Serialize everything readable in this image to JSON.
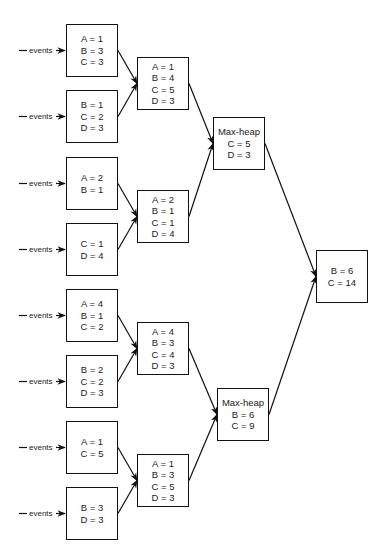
{
  "diagram": {
    "input_label": "events",
    "leaves": [
      {
        "id": "leaf1",
        "lines": [
          "A = 1",
          "B = 3",
          "C = 3"
        ]
      },
      {
        "id": "leaf2",
        "lines": [
          "B = 1",
          "C = 2",
          "D = 3"
        ]
      },
      {
        "id": "leaf3",
        "lines": [
          "A = 2",
          "B = 1"
        ]
      },
      {
        "id": "leaf4",
        "lines": [
          "C = 1",
          "D = 4"
        ]
      },
      {
        "id": "leaf5",
        "lines": [
          "A = 4",
          "B = 1",
          "C = 2"
        ]
      },
      {
        "id": "leaf6",
        "lines": [
          "B = 2",
          "C = 2",
          "D = 3"
        ]
      },
      {
        "id": "leaf7",
        "lines": [
          "A = 1",
          "C = 5"
        ]
      },
      {
        "id": "leaf8",
        "lines": [
          "B = 3",
          "D = 3"
        ]
      }
    ],
    "merges": [
      {
        "id": "merge1",
        "lines": [
          "A = 1",
          "B = 4",
          "C = 5",
          "D = 3"
        ]
      },
      {
        "id": "merge2",
        "lines": [
          "A = 2",
          "B = 1",
          "C = 1",
          "D = 4"
        ]
      },
      {
        "id": "merge3",
        "lines": [
          "A = 4",
          "B = 3",
          "C = 4",
          "D = 3"
        ]
      },
      {
        "id": "merge4",
        "lines": [
          "A = 1",
          "B = 3",
          "C = 5",
          "D = 3"
        ]
      }
    ],
    "heaps": [
      {
        "id": "heap1",
        "lines": [
          "Max-heap",
          "C = 5",
          "D = 3"
        ]
      },
      {
        "id": "heap2",
        "lines": [
          "Max-heap",
          "B = 6",
          "C = 9"
        ]
      }
    ],
    "result": {
      "id": "result",
      "lines": [
        "B = 6",
        "C = 14"
      ]
    }
  }
}
